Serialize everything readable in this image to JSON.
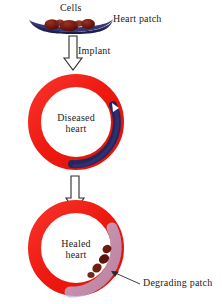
{
  "diagram": {
    "title_text_font_color": "#1c1c1c",
    "background": "#ffffff",
    "labels": {
      "cells": "Cells",
      "heart_patch": "Heart patch",
      "implant": "Implant",
      "diseased_heart": "Diseased\nheart",
      "diseased_heart_line1": "Diseased",
      "diseased_heart_line2": "heart",
      "healed_heart_line1": "Healed",
      "healed_heart_line2": "heart",
      "degrading_patch": "Degrading patch"
    },
    "colors": {
      "heart_ring_red": "#f01e14",
      "heart_ring_red_dark": "#d8160e",
      "patch_navy": "#2b2b6e",
      "patch_navy_dark": "#1d1d50",
      "cells_maroon": "#7d1f14",
      "cells_maroon_dark": "#5e1108",
      "degrading_lavender": "#b9b0d8",
      "arrow_outline": "#2a2a2a",
      "arrow_fill": "#ffffff",
      "text": "#1c1c1c"
    },
    "steps": [
      {
        "name": "heart-patch-with-cells",
        "caption": "Heart patch"
      },
      {
        "name": "implant-arrow",
        "caption": "Implant"
      },
      {
        "name": "diseased-heart",
        "caption": "Diseased heart"
      },
      {
        "name": "transition-arrow",
        "caption": ""
      },
      {
        "name": "healed-heart",
        "caption": "Healed heart"
      },
      {
        "name": "degrading-patch-callout",
        "caption": "Degrading patch"
      }
    ]
  }
}
